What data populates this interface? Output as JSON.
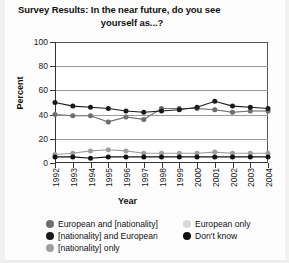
{
  "chart_data": {
    "type": "line",
    "title": "Survey Results: In the near future, do you see yourself as...?",
    "title_line1": "Survey Results: In the near future, do you see",
    "title_line2": "yourself as...?",
    "xlabel": "Year",
    "ylabel": "Percent",
    "ylim": [
      0,
      100
    ],
    "yticks": [
      0,
      20,
      40,
      60,
      80,
      100
    ],
    "grid": true,
    "grid_axis": "y",
    "legend_position": "bottom",
    "categories": [
      "1992",
      "1993",
      "1994",
      "1995",
      "1996",
      "1997",
      "1998",
      "1999",
      "2000",
      "2001",
      "2002",
      "2003",
      "2004"
    ],
    "series": [
      {
        "name": "European and [nationality]",
        "color": "#6e6e6e",
        "values": [
          40,
          39,
          39,
          34,
          38,
          36,
          45,
          45,
          45,
          44,
          42,
          43,
          43
        ]
      },
      {
        "name": "[nationality] and European",
        "color": "#1a1a1a",
        "values": [
          50,
          47,
          46,
          45,
          43,
          42,
          43,
          44,
          46,
          51,
          47,
          46,
          45
        ]
      },
      {
        "name": "[nationality] only",
        "color": "#9e9e9e",
        "values": [
          7,
          8,
          10,
          11,
          10,
          8,
          8,
          8,
          8,
          9,
          8,
          8,
          8
        ]
      },
      {
        "name": "European only",
        "color": "#d9d9d9",
        "values": [
          40,
          39,
          39,
          34,
          38,
          36,
          45,
          45,
          45,
          44,
          42,
          43,
          43
        ]
      },
      {
        "name": "Don't know",
        "color": "#111111",
        "values": [
          5,
          5,
          4,
          5,
          5,
          5,
          5,
          5,
          5,
          5,
          5,
          5,
          5
        ]
      }
    ]
  },
  "legend": {
    "items": [
      {
        "label": "European and [nationality]",
        "color": "#6e6e6e"
      },
      {
        "label": "[nationality] and European",
        "color": "#1a1a1a"
      },
      {
        "label": "[nationality] only",
        "color": "#9e9e9e"
      },
      {
        "label": "European only",
        "color": "#d9d9d9"
      },
      {
        "label": "Don't know",
        "color": "#111111"
      }
    ]
  }
}
